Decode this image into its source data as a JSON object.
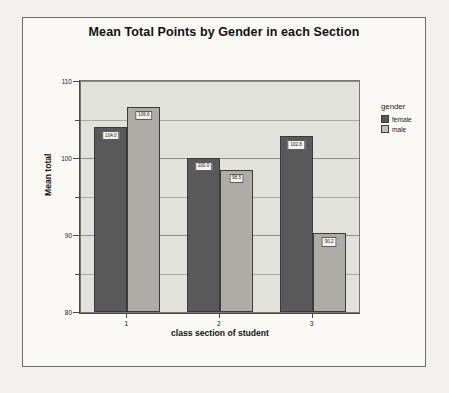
{
  "chart_data": {
    "type": "bar",
    "title": "Mean Total Points by Gender in each Section",
    "xlabel": "class section of student",
    "ylabel": "Mean total",
    "categories": [
      "1",
      "2",
      "3"
    ],
    "series": [
      {
        "name": "female",
        "values": [
          104.0,
          100.0,
          102.8
        ],
        "color": "#595959"
      },
      {
        "name": "male",
        "values": [
          106.6,
          98.5,
          90.2
        ],
        "color": "#adaca6"
      }
    ],
    "data_labels": [
      [
        "104.0",
        "100.0",
        "102.8"
      ],
      [
        "106.6",
        "98.5",
        "90.2"
      ]
    ],
    "ylim": [
      80,
      110
    ],
    "yticks": [
      110,
      100,
      90,
      80
    ],
    "ytick_labels": [
      "110",
      "100",
      "90",
      "80"
    ],
    "yminor_ticks": [
      105,
      95,
      85
    ],
    "grid": true,
    "legend_title": "gender",
    "legend_position": "right",
    "legend_entries": [
      "female",
      "male"
    ]
  },
  "legend": {
    "title": "gender",
    "items": [
      {
        "label": "female"
      },
      {
        "label": "male"
      }
    ]
  },
  "axes": {
    "y_title": "Mean total",
    "x_title": "class section of student",
    "y_labels": [
      "110",
      "100",
      "90",
      "80"
    ],
    "x_labels": [
      "1",
      "2",
      "3"
    ]
  },
  "title": "Mean Total Points by Gender in each Section"
}
